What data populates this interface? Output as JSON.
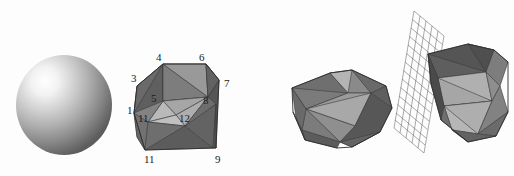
{
  "figure": {
    "background_color": "#fdfdfd",
    "ink_color": "#1b1b1b",
    "panels": [
      {
        "name": "sphere-panel",
        "description": "smooth shaded sphere"
      },
      {
        "name": "labeled-polyhedron-panel",
        "description": "triangulated polyhedron with numbered vertices"
      },
      {
        "name": "polyhedra-pair-panel",
        "description": "two triangulated polyhedra with a wireframe grid plane"
      }
    ]
  },
  "sphere": {
    "name": "shaded-sphere",
    "center": [
      64,
      105
    ],
    "radius_x": 48,
    "radius_y": 50,
    "highlight": [
      44,
      72
    ],
    "highlight_color": "#ffffff",
    "mid_color": "#bdbdbd",
    "shadow_color": "#5d5d5d"
  },
  "polyhedron_labeled": {
    "name": "labeled-polyhedron",
    "vertex_labels": [
      {
        "id": "3",
        "text": "3",
        "x": 131,
        "y": 79
      },
      {
        "id": "4",
        "text": "4",
        "x": 156,
        "y": 58
      },
      {
        "id": "6",
        "text": "6",
        "x": 199,
        "y": 58
      },
      {
        "id": "7",
        "text": "7",
        "x": 225,
        "y": 84
      },
      {
        "id": "1",
        "text": "1",
        "x": 127,
        "y": 111
      },
      {
        "id": "5",
        "text": "5",
        "x": 152,
        "y": 98
      },
      {
        "id": "8",
        "text": "8",
        "x": 204,
        "y": 100
      },
      {
        "id": "11b",
        "text": "11",
        "x": 139,
        "y": 119
      },
      {
        "id": "12",
        "text": "12",
        "x": 180,
        "y": 119
      },
      {
        "id": "11",
        "text": "11",
        "x": 145,
        "y": 160
      },
      {
        "id": "9",
        "text": "9",
        "x": 216,
        "y": 160
      }
    ],
    "face_shades": [
      "#6b6b6b",
      "#7d7d7d",
      "#8c8c8c",
      "#9b9b9b",
      "#a8a8a8",
      "#b4b4b4",
      "#5e5e5e",
      "#555555"
    ]
  },
  "polyhedron_left_pair": {
    "name": "polyhedron-front",
    "face_shades": [
      "#7a7a7a",
      "#8a8a8a",
      "#9a9a9a",
      "#a9a9a9",
      "#b6b6b6",
      "#666666",
      "#5a5a5a"
    ]
  },
  "grid_plane": {
    "name": "wireframe-grid-plane",
    "columns": 5,
    "rows": 11,
    "line_color": "#6e6e6e"
  },
  "polyhedron_right_pair": {
    "name": "polyhedron-back",
    "face_shades": [
      "#7a7a7a",
      "#8c8c8c",
      "#9c9c9c",
      "#ababab",
      "#b8b8b8",
      "#636363",
      "#565656"
    ]
  }
}
